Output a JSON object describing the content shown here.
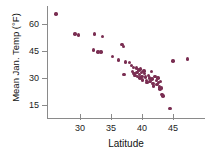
{
  "chart_data": {
    "type": "scatter",
    "title": "",
    "xlabel": "Latitude",
    "ylabel": "Mean Jan. Temp (°F)",
    "xlim": [
      25,
      48.5
    ],
    "ylim": [
      10,
      68
    ],
    "xticks": [
      30,
      35,
      40,
      45
    ],
    "yticks": [
      15,
      30,
      45,
      60
    ],
    "xtick_labels": [
      "30",
      "35",
      "40",
      "45"
    ],
    "ytick_labels": [
      "15",
      "30",
      "45",
      "60"
    ],
    "grid": false,
    "legend": "none",
    "marker_color": "#7a2e52",
    "axis_color": "#8a8a8a",
    "series": [
      {
        "name": "US cities",
        "points": [
          [
            26.1,
            65.5
          ],
          [
            29.2,
            54.5
          ],
          [
            29.8,
            54.0
          ],
          [
            32.3,
            54.5
          ],
          [
            33.6,
            53.0
          ],
          [
            32.2,
            45.5
          ],
          [
            32.9,
            44.5
          ],
          [
            33.4,
            44.5
          ],
          [
            35.2,
            42.0
          ],
          [
            36.8,
            48.5
          ],
          [
            37.0,
            47.5
          ],
          [
            36.2,
            40.0
          ],
          [
            37.3,
            39.0
          ],
          [
            37.1,
            32.0
          ],
          [
            38.0,
            38.5
          ],
          [
            38.3,
            37.0
          ],
          [
            38.6,
            36.0
          ],
          [
            38.5,
            33.5
          ],
          [
            38.7,
            32.5
          ],
          [
            38.9,
            31.5
          ],
          [
            39.1,
            35.5
          ],
          [
            39.2,
            33.0
          ],
          [
            39.3,
            31.0
          ],
          [
            39.5,
            34.5
          ],
          [
            39.6,
            32.0
          ],
          [
            39.7,
            30.0
          ],
          [
            39.8,
            35.0
          ],
          [
            39.9,
            33.0
          ],
          [
            40.0,
            31.0
          ],
          [
            40.1,
            29.0
          ],
          [
            40.3,
            34.0
          ],
          [
            40.4,
            32.5
          ],
          [
            40.6,
            30.5
          ],
          [
            40.7,
            28.5
          ],
          [
            40.8,
            27.5
          ],
          [
            41.0,
            31.5
          ],
          [
            41.2,
            30.0
          ],
          [
            41.3,
            28.0
          ],
          [
            41.5,
            33.5
          ],
          [
            41.6,
            29.5
          ],
          [
            41.8,
            27.0
          ],
          [
            41.9,
            25.5
          ],
          [
            42.1,
            31.0
          ],
          [
            42.3,
            28.5
          ],
          [
            42.4,
            26.5
          ],
          [
            42.6,
            30.0
          ],
          [
            42.7,
            27.5
          ],
          [
            42.8,
            25.0
          ],
          [
            42.9,
            24.0
          ],
          [
            43.0,
            28.0
          ],
          [
            43.1,
            24.5
          ],
          [
            43.2,
            21.0
          ],
          [
            43.4,
            20.0
          ],
          [
            44.5,
            13.0
          ],
          [
            45.0,
            39.5
          ],
          [
            47.3,
            40.5
          ]
        ]
      }
    ]
  }
}
